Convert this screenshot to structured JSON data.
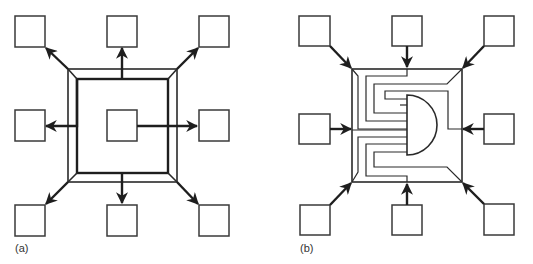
{
  "figure": {
    "panels": [
      {
        "id": "a",
        "label": "(a)",
        "description": "Central box with outward arrows to eight peripheral boxes via a beveled double frame (fan-out)",
        "peripheral_boxes": 8,
        "center_box": true,
        "arrow_direction": "outward"
      },
      {
        "id": "b",
        "label": "(b)",
        "description": "Eight peripheral boxes with inward arrows feeding wires into a central AND-gate shape (fan-in)",
        "peripheral_boxes": 8,
        "center_shape": "and-gate",
        "arrow_direction": "inward"
      }
    ],
    "colors": {
      "stroke": "#2a2a2a",
      "background": "#ffffff"
    }
  }
}
